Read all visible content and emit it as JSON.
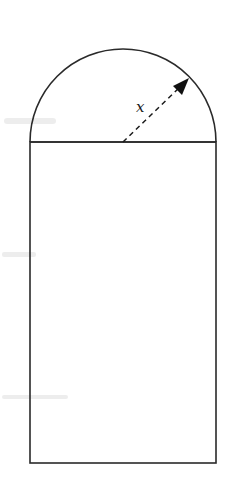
{
  "figure": {
    "canvas": {
      "width": 226,
      "height": 491
    },
    "colors": {
      "stroke": "#2a2a2a",
      "background": "#ffffff"
    },
    "rectangle": {
      "x": 30,
      "y": 142,
      "width": 186,
      "height": 321
    },
    "semicircle": {
      "cx": 123,
      "cy": 142,
      "r": 93
    },
    "radius_arrow": {
      "from": {
        "x": 123,
        "y": 142
      },
      "to": {
        "x": 188,
        "y": 79
      },
      "style": "dashed",
      "label": "x",
      "label_position": {
        "x": 141,
        "y": 111
      }
    }
  }
}
